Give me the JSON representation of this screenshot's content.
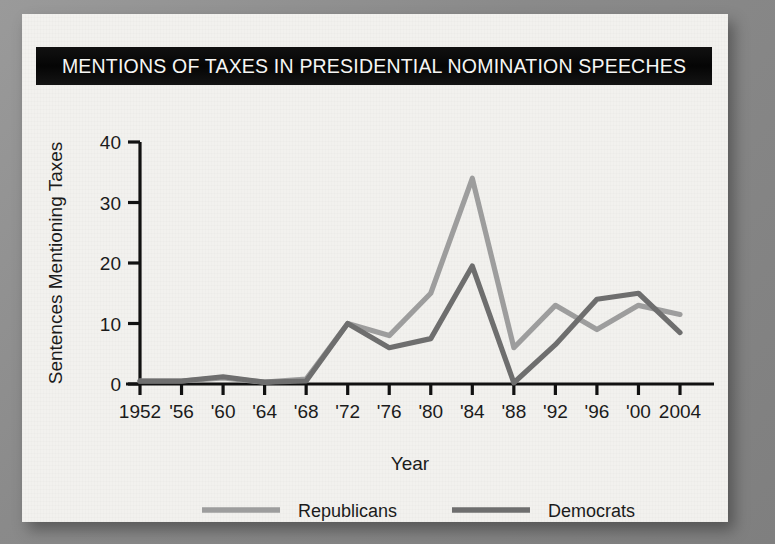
{
  "figure": {
    "title": "MENTIONS OF TAXES IN PRESIDENTIAL NOMINATION SPEECHES",
    "background_color": "#f2f1ee",
    "title_banner_color": "#0a0a0a",
    "title_text_color": "#f6f6f4"
  },
  "chart_data": {
    "type": "line",
    "title": "MENTIONS OF TAXES IN PRESIDENTIAL NOMINATION SPEECHES",
    "xlabel": "Year",
    "ylabel": "Sentences Mentioning Taxes",
    "categories": [
      "1952",
      "'56",
      "'60",
      "'64",
      "'68",
      "'72",
      "'76",
      "'80",
      "'84",
      "'88",
      "'92",
      "'96",
      "'00",
      "2004"
    ],
    "x_values": [
      1952,
      1956,
      1960,
      1964,
      1968,
      1972,
      1976,
      1980,
      1984,
      1988,
      1992,
      1996,
      2000,
      2004
    ],
    "ylim": [
      0,
      40
    ],
    "xlim": [
      1952,
      2004
    ],
    "yticks": [
      0,
      10,
      20,
      30,
      40
    ],
    "ytick_labels": [
      "0",
      "10",
      "20",
      "30",
      "40"
    ],
    "grid": false,
    "legend_position": "below",
    "series": [
      {
        "name": "Republicans",
        "color": "#9d9d9d",
        "values": [
          0.5,
          0.5,
          1.0,
          0.3,
          0.8,
          10.0,
          8.0,
          15.0,
          34.0,
          6.0,
          13.0,
          9.0,
          13.0,
          11.5
        ]
      },
      {
        "name": "Democrats",
        "color": "#6e6e6e",
        "values": [
          0.5,
          0.5,
          1.2,
          0.3,
          0.5,
          10.0,
          6.0,
          7.5,
          19.5,
          0.2,
          6.5,
          14.0,
          15.0,
          8.5
        ]
      }
    ]
  },
  "legend": {
    "items": [
      {
        "label": "Republicans",
        "color": "#9d9d9d"
      },
      {
        "label": "Democrats",
        "color": "#6e6e6e"
      }
    ]
  },
  "axis": {
    "y_title": "Sentences Mentioning Taxes",
    "x_title": "Year"
  }
}
